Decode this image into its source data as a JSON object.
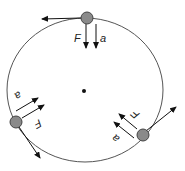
{
  "diagram": {
    "colors": {
      "orbit": "#555555",
      "ball_fill": "#8a8a8a",
      "ball_stroke": "#444444",
      "arrow": "#111111",
      "center": "#111111"
    },
    "center_point": {
      "x": 84,
      "y": 91
    },
    "orbit": {
      "cx": 85,
      "cy": 90,
      "rx": 78,
      "ry": 72
    },
    "objects": [
      {
        "name": "top",
        "x": 87,
        "y": 18,
        "velocity_arrow": {
          "x2": 42,
          "y2": 19
        },
        "force_label": "F",
        "accel_label": "a",
        "force_arrow": {
          "x1": 86,
          "y1": 24,
          "x2": 86,
          "y2": 48
        },
        "accel_arrow": {
          "x1": 96,
          "y1": 24,
          "x2": 96,
          "y2": 48
        }
      },
      {
        "name": "left",
        "x": 16,
        "y": 122,
        "velocity_arrow": {
          "x2": 40,
          "y2": 158
        },
        "force_label": "F",
        "accel_label": "a",
        "force_arrow": {
          "x1": 22,
          "y1": 118,
          "x2": 44,
          "y2": 105
        },
        "accel_arrow": {
          "x1": 16,
          "y1": 111,
          "x2": 38,
          "y2": 98
        }
      },
      {
        "name": "right",
        "x": 143,
        "y": 135,
        "velocity_arrow": {
          "x2": 176,
          "y2": 107
        },
        "force_label": "F",
        "accel_label": "a",
        "force_arrow": {
          "x1": 137,
          "y1": 129,
          "x2": 119,
          "y2": 114
        },
        "accel_arrow": {
          "x1": 134,
          "y1": 138,
          "x2": 114,
          "y2": 122
        }
      }
    ]
  }
}
